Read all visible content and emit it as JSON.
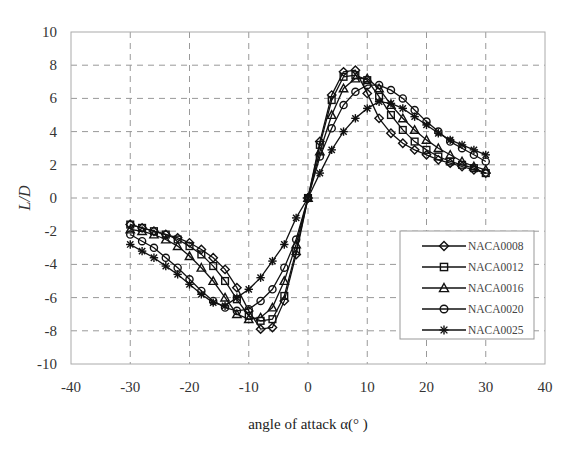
{
  "chart_data": {
    "type": "line",
    "title": "",
    "xlabel": "angle of attack  α(° )",
    "ylabel": "L/D",
    "xlim": [
      -40,
      40
    ],
    "ylim": [
      -10,
      10
    ],
    "xticks": [
      -40,
      -30,
      -20,
      -10,
      0,
      10,
      20,
      30,
      40
    ],
    "yticks": [
      -10,
      -8,
      -6,
      -4,
      -2,
      0,
      2,
      4,
      6,
      8,
      10
    ],
    "grid": true,
    "grid_style": "dashed",
    "legend_position": "lower right (inside)",
    "x": [
      -30,
      -28,
      -26,
      -24,
      -22,
      -20,
      -18,
      -16,
      -14,
      -12,
      -10,
      -8,
      -6,
      -4,
      -2,
      0,
      2,
      4,
      6,
      8,
      10,
      12,
      14,
      16,
      18,
      20,
      22,
      24,
      26,
      28,
      30
    ],
    "series": [
      {
        "name": "NACA0008",
        "marker": "diamond",
        "values": [
          -1.6,
          -1.8,
          -2.0,
          -2.2,
          -2.4,
          -2.7,
          -3.1,
          -3.6,
          -4.3,
          -5.4,
          -6.8,
          -7.9,
          -7.8,
          -6.2,
          -3.4,
          0.0,
          3.4,
          6.2,
          7.6,
          7.7,
          6.3,
          4.8,
          3.9,
          3.3,
          2.9,
          2.6,
          2.3,
          2.1,
          1.9,
          1.7,
          1.5
        ]
      },
      {
        "name": "NACA0012",
        "marker": "square",
        "values": [
          -1.6,
          -1.8,
          -2.0,
          -2.2,
          -2.5,
          -2.9,
          -3.4,
          -4.1,
          -5.0,
          -6.1,
          -7.1,
          -7.4,
          -7.3,
          -5.9,
          -3.2,
          0.0,
          3.2,
          5.9,
          7.3,
          7.4,
          7.1,
          6.1,
          5.0,
          4.1,
          3.4,
          2.9,
          2.5,
          2.2,
          2.0,
          1.8,
          1.5
        ]
      },
      {
        "name": "NACA0016",
        "marker": "triangle",
        "values": [
          -1.9,
          -2.0,
          -2.2,
          -2.5,
          -2.9,
          -3.5,
          -4.2,
          -5.0,
          -6.0,
          -7.0,
          -7.3,
          -7.2,
          -6.6,
          -5.0,
          -2.8,
          0.0,
          2.8,
          5.0,
          6.6,
          7.2,
          7.2,
          6.6,
          5.6,
          4.8,
          4.1,
          3.5,
          3.0,
          2.6,
          2.2,
          1.9,
          1.7
        ]
      },
      {
        "name": "NACA0020",
        "marker": "circle",
        "values": [
          -2.2,
          -2.6,
          -3.0,
          -3.6,
          -4.2,
          -4.9,
          -5.6,
          -6.2,
          -6.6,
          -6.8,
          -6.7,
          -6.2,
          -5.5,
          -4.2,
          -2.5,
          0.0,
          2.5,
          4.2,
          5.6,
          6.4,
          6.8,
          6.8,
          6.5,
          6.0,
          5.3,
          4.6,
          4.0,
          3.4,
          3.0,
          2.6,
          2.2
        ]
      },
      {
        "name": "NACA0025",
        "marker": "star",
        "values": [
          -2.8,
          -3.2,
          -3.6,
          -4.1,
          -4.6,
          -5.2,
          -5.8,
          -6.3,
          -6.5,
          -6.0,
          -5.5,
          -4.8,
          -3.8,
          -2.8,
          -1.2,
          0.0,
          1.5,
          2.9,
          4.0,
          4.8,
          5.4,
          5.8,
          5.7,
          5.4,
          4.9,
          4.4,
          3.9,
          3.5,
          3.2,
          2.9,
          2.6
        ]
      }
    ]
  },
  "axes": {
    "x_title": "angle of attack  α(° )",
    "y_title": "L/D"
  },
  "legend": {
    "items": [
      "NACA0008",
      "NACA0012",
      "NACA0016",
      "NACA0020",
      "NACA0025"
    ]
  }
}
